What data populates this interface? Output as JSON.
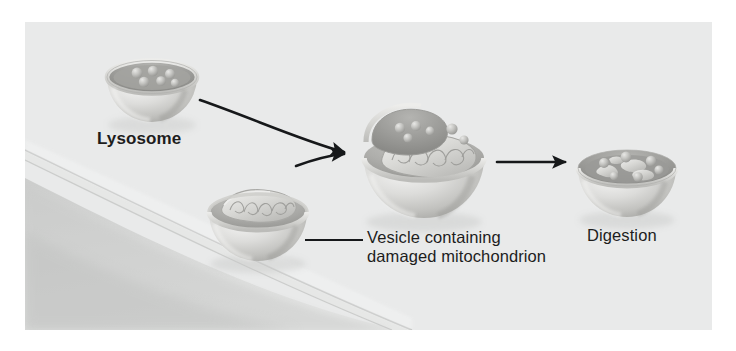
{
  "figure": {
    "background_color": "#e9eaea",
    "page_color": "#ffffff",
    "ink_color": "#1d1d1d"
  },
  "labels": {
    "lysosome": "Lysosome",
    "vesicle_line1": "Vesicle containing",
    "vesicle_line2": "damaged mitochondrion",
    "digestion": "Digestion"
  },
  "stages": [
    {
      "id": "lysosome",
      "name": "Lysosome",
      "description": "Cut-away spherical lysosome containing digestive enzyme granules",
      "center": [
        150,
        88
      ],
      "radius": 45,
      "granule_count": 6
    },
    {
      "id": "vesicle",
      "name": "Vesicle containing damaged mitochondrion",
      "description": "Cut-away vesicle enclosing a damaged mitochondrion with cristae",
      "center": [
        258,
        215
      ],
      "radius": 50
    },
    {
      "id": "fusion",
      "name": "Fusion of lysosome and vesicle",
      "description": "Lysosome fusing with the vesicle, enzymes entering with the mitochondrion",
      "center": [
        420,
        160
      ],
      "radius": 62
    },
    {
      "id": "digestion",
      "name": "Digestion",
      "description": "Mitochondrion broken into fragments and granules inside the vesicle",
      "center": [
        627,
        170
      ],
      "radius": 50
    }
  ],
  "arrows": [
    {
      "id": "lysosome-to-fusion",
      "type": "curved",
      "from": "lysosome",
      "to": "fusion"
    },
    {
      "id": "vesicle-to-fusion",
      "type": "curved",
      "from": "vesicle",
      "to": "fusion"
    },
    {
      "id": "fusion-to-digestion",
      "type": "straight",
      "from": "fusion",
      "to": "digestion"
    }
  ],
  "leaders": [
    {
      "id": "vesicle-leader",
      "from": [
        305,
        240
      ],
      "to": [
        362,
        240
      ]
    }
  ],
  "cell_membrane": {
    "id": "cell-membrane",
    "description": "Curved plasma membrane sweeping across the lower left of the panel"
  }
}
